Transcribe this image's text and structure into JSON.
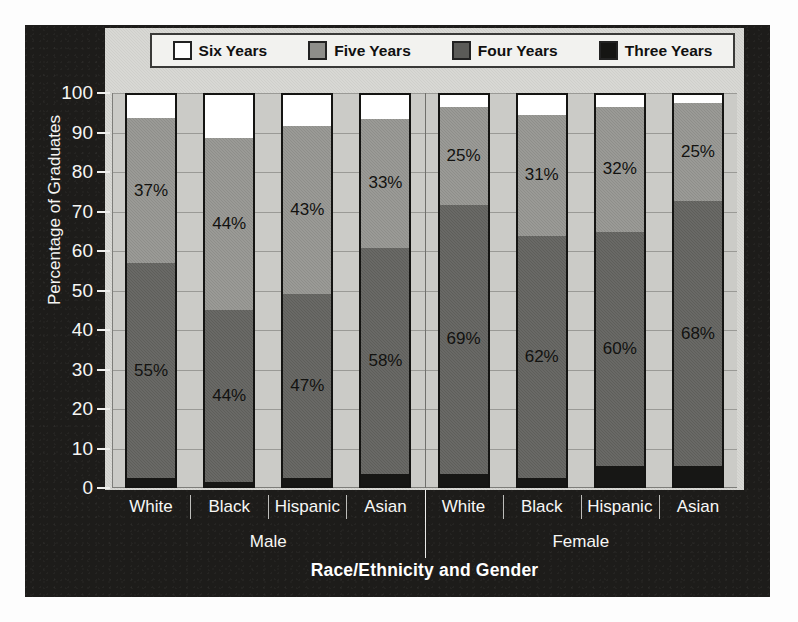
{
  "chart_data": {
    "type": "bar",
    "subtype": "stacked-bar-100",
    "title": "",
    "xlabel": "Race/Ethnicity and Gender",
    "ylabel": "Percentage of Graduates",
    "ylim": [
      0,
      100
    ],
    "ytick_step": 10,
    "yticks": [
      100,
      90,
      80,
      70,
      60,
      50,
      40,
      30,
      20,
      10,
      0
    ],
    "grid": true,
    "legend_position": "top",
    "categories": [
      "White",
      "Black",
      "Hispanic",
      "Asian",
      "White",
      "Black",
      "Hispanic",
      "Asian"
    ],
    "groups": [
      {
        "label": "Male",
        "categories": [
          "White",
          "Black",
          "Hispanic",
          "Asian"
        ]
      },
      {
        "label": "Female",
        "categories": [
          "White",
          "Black",
          "Hispanic",
          "Asian"
        ]
      }
    ],
    "series": [
      {
        "name": "Three Years",
        "color": "#171715",
        "values": [
          2,
          1,
          2,
          3,
          3,
          2,
          5,
          5
        ]
      },
      {
        "name": "Four Years",
        "color": "#5e5e5a",
        "values": [
          55,
          44,
          47,
          58,
          69,
          62,
          60,
          68
        ]
      },
      {
        "name": "Five Years",
        "color": "#8e8e8a",
        "values": [
          37,
          44,
          43,
          33,
          25,
          31,
          32,
          25
        ]
      },
      {
        "name": "Six Years",
        "color": "#ffffff",
        "values": [
          6,
          11,
          8,
          6,
          3,
          5,
          3,
          2
        ]
      }
    ],
    "bars": [
      {
        "group": "Male",
        "category": "White",
        "segments": [
          {
            "series": "Three Years",
            "value": 2,
            "label": ""
          },
          {
            "series": "Four Years",
            "value": 55,
            "label": "55%"
          },
          {
            "series": "Five Years",
            "value": 37,
            "label": "37%"
          },
          {
            "series": "Six Years",
            "value": 6,
            "label": ""
          }
        ]
      },
      {
        "group": "Male",
        "category": "Black",
        "segments": [
          {
            "series": "Three Years",
            "value": 1,
            "label": ""
          },
          {
            "series": "Four Years",
            "value": 44,
            "label": "44%"
          },
          {
            "series": "Five Years",
            "value": 44,
            "label": "44%"
          },
          {
            "series": "Six Years",
            "value": 11,
            "label": ""
          }
        ]
      },
      {
        "group": "Male",
        "category": "Hispanic",
        "segments": [
          {
            "series": "Three Years",
            "value": 2,
            "label": ""
          },
          {
            "series": "Four Years",
            "value": 47,
            "label": "47%"
          },
          {
            "series": "Five Years",
            "value": 43,
            "label": "43%"
          },
          {
            "series": "Six Years",
            "value": 8,
            "label": ""
          }
        ]
      },
      {
        "group": "Male",
        "category": "Asian",
        "segments": [
          {
            "series": "Three Years",
            "value": 3,
            "label": ""
          },
          {
            "series": "Four Years",
            "value": 58,
            "label": "58%"
          },
          {
            "series": "Five Years",
            "value": 33,
            "label": "33%"
          },
          {
            "series": "Six Years",
            "value": 6,
            "label": ""
          }
        ]
      },
      {
        "group": "Female",
        "category": "White",
        "segments": [
          {
            "series": "Three Years",
            "value": 3,
            "label": ""
          },
          {
            "series": "Four Years",
            "value": 69,
            "label": "69%"
          },
          {
            "series": "Five Years",
            "value": 25,
            "label": "25%"
          },
          {
            "series": "Six Years",
            "value": 3,
            "label": ""
          }
        ]
      },
      {
        "group": "Female",
        "category": "Black",
        "segments": [
          {
            "series": "Three Years",
            "value": 2,
            "label": ""
          },
          {
            "series": "Four Years",
            "value": 62,
            "label": "62%"
          },
          {
            "series": "Five Years",
            "value": 31,
            "label": "31%"
          },
          {
            "series": "Six Years",
            "value": 5,
            "label": ""
          }
        ]
      },
      {
        "group": "Female",
        "category": "Hispanic",
        "segments": [
          {
            "series": "Three Years",
            "value": 5,
            "label": ""
          },
          {
            "series": "Four Years",
            "value": 60,
            "label": "60%"
          },
          {
            "series": "Five Years",
            "value": 32,
            "label": "32%"
          },
          {
            "series": "Six Years",
            "value": 3,
            "label": ""
          }
        ]
      },
      {
        "group": "Female",
        "category": "Asian",
        "segments": [
          {
            "series": "Three Years",
            "value": 5,
            "label": ""
          },
          {
            "series": "Four Years",
            "value": 68,
            "label": "68%"
          },
          {
            "series": "Five Years",
            "value": 25,
            "label": "25%"
          },
          {
            "series": "Six Years",
            "value": 2,
            "label": ""
          }
        ]
      }
    ]
  },
  "legend": {
    "items": [
      {
        "label": "Six Years",
        "swatch": "sw-six",
        "icon": "legend-swatch-white"
      },
      {
        "label": "Five Years",
        "swatch": "sw-five",
        "icon": "legend-swatch-light-gray"
      },
      {
        "label": "Four Years",
        "swatch": "sw-four",
        "icon": "legend-swatch-dark-gray"
      },
      {
        "label": "Three Years",
        "swatch": "sw-three",
        "icon": "legend-swatch-black"
      }
    ]
  },
  "colors": {
    "panel_background": "#1d1c1a",
    "plot_background": "#cbcbc7",
    "six_years": "#ffffff",
    "five_years": "#8e8e8a",
    "four_years": "#5e5e5a",
    "three_years": "#171715",
    "text_light": "#f6f6f4"
  }
}
